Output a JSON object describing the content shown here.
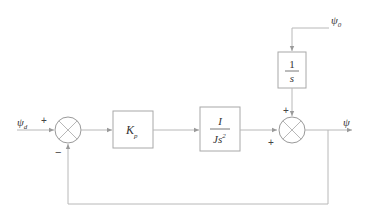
{
  "diagram": {
    "type": "control-block-diagram",
    "input": {
      "symbol": "ψ",
      "subscript": "d"
    },
    "disturbance": {
      "symbol": "ψ",
      "subscript": "0"
    },
    "output": {
      "symbol": "ψ"
    },
    "summing_junction_1": {
      "sign_input": "+",
      "sign_feedback": "−"
    },
    "summing_junction_2": {
      "sign_top": "+",
      "sign_left": "+"
    },
    "blocks": {
      "controller": {
        "symbol": "K",
        "subscript": "p"
      },
      "plant": {
        "numerator": "I",
        "denominator": "Js",
        "denominator_power": "2"
      },
      "integrator": {
        "numerator": "1",
        "denominator": "s"
      }
    },
    "colors": {
      "line": "#b8b8b8",
      "text": "#333333",
      "background": "#ffffff"
    }
  }
}
